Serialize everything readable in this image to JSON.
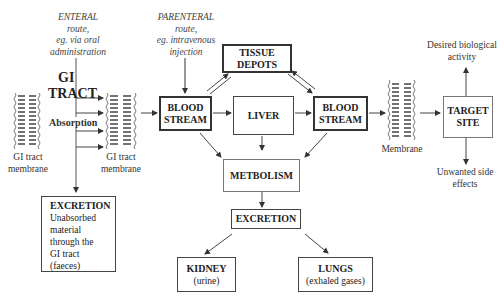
{
  "enteral": {
    "title": "ENTERAL",
    "lines": [
      "route,",
      "eg. via oral",
      "administration"
    ]
  },
  "parenteral": {
    "title": "PARENTERAL",
    "lines": [
      "route,",
      "eg. intravenous",
      "injection"
    ]
  },
  "gi_tract": {
    "line1": "GI",
    "line2": "TRACT"
  },
  "absorption": "Absorption",
  "membranes": {
    "left": {
      "line1": "GI tract",
      "line2": "membrane"
    },
    "middle": {
      "line1": "GI tract",
      "line2": "membrane"
    },
    "right": "Membrane"
  },
  "boxes": {
    "blood_stream_1": {
      "line1": "BLOOD",
      "line2": "STREAM"
    },
    "liver": "LIVER",
    "blood_stream_2": {
      "line1": "BLOOD",
      "line2": "STREAM"
    },
    "tissue_depots": {
      "line1": "TISSUE",
      "line2": "DEPOTS"
    },
    "target_site": {
      "line1": "TARGET",
      "line2": "SITE"
    },
    "metabolism": "METBOLISM",
    "excretion_main": "EXCRETION",
    "kidney": {
      "title": "KIDNEY",
      "sub": "(urine)"
    },
    "lungs": {
      "title": "LUNGS",
      "sub": "(exhaled gases)"
    },
    "excretion_gi": {
      "title": "EXCRETION",
      "lines": [
        "Unabsorbed",
        "material",
        "through the",
        "GI tract",
        "(faeces)"
      ]
    }
  },
  "outcomes": {
    "desired": {
      "line1": "Desired  biological",
      "line2": "activity"
    },
    "unwanted": {
      "line1": "Unwanted side",
      "line2": "effects"
    }
  }
}
